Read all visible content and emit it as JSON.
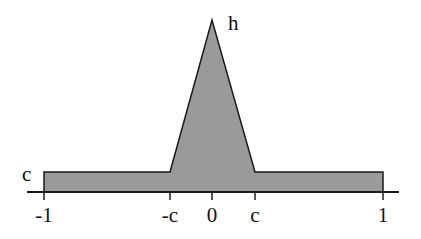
{
  "diagram": {
    "title": "",
    "shape": "plateau with central triangular peak",
    "colors": {
      "fill": "#9a9a9a",
      "stroke": "#1a1a1a",
      "background": "#ffffff"
    },
    "labels": {
      "peak": "h",
      "plateau": "c"
    },
    "axis": {
      "ticks": [
        {
          "label": "-1",
          "value": -1
        },
        {
          "label": "-c",
          "value": "-c"
        },
        {
          "label": "0",
          "value": 0
        },
        {
          "label": "c",
          "value": "c"
        },
        {
          "label": "1",
          "value": 1
        }
      ]
    }
  }
}
